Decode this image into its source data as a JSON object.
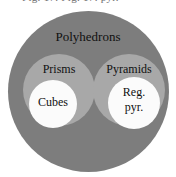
{
  "figure": {
    "cropped_caption": "Fig. 17.     Fig. 17. pyr.",
    "colors": {
      "background": "#ffffff",
      "outer_set_fill": "#7d7d7d",
      "mid_set_fill": "#a8a8a8",
      "inner_set_fill": "#fbfbfb",
      "label_text": "#101010"
    }
  },
  "chart_data": {
    "type": "diagram",
    "diagram_kind": "euler-nested-sets",
    "title": "Polyhedrons",
    "sets": [
      {
        "label": "Polyhedrons",
        "level": 0,
        "fill": "#7d7d7d",
        "contains": [
          "Prisms",
          "Pyramids"
        ]
      },
      {
        "label": "Prisms",
        "level": 1,
        "fill": "#a8a8a8",
        "parent": "Polyhedrons",
        "contains": [
          "Cubes"
        ]
      },
      {
        "label": "Pyramids",
        "level": 1,
        "fill": "#a8a8a8",
        "parent": "Polyhedrons",
        "contains": [
          "Reg. pyr."
        ]
      },
      {
        "label": "Cubes",
        "level": 2,
        "fill": "#fbfbfb",
        "parent": "Prisms",
        "contains": []
      },
      {
        "label": "Reg. pyr.",
        "level": 2,
        "fill": "#fbfbfb",
        "parent": "Pyramids",
        "contains": []
      }
    ]
  },
  "labels": {
    "outer": "Polyhedrons",
    "mid_left": "Prisms",
    "mid_right": "Pyramids",
    "inner_left": "Cubes",
    "inner_right_line1": "Reg.",
    "inner_right_line2": "pyr."
  }
}
